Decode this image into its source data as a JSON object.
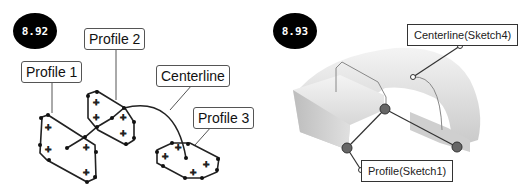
{
  "figures": [
    {
      "badge": "8.92",
      "labels": {
        "profile1": "Profile 1",
        "profile2": "Profile 2",
        "centerline": "Centerline",
        "profile3": "Profile 3"
      }
    },
    {
      "badge": "8.93",
      "labels": {
        "centerline": "Centerline(Sketch4)",
        "profile": "Profile(Sketch1)"
      }
    }
  ],
  "colors": {
    "badge_bg": "#000000",
    "sketch_line": "#222222",
    "leader_line": "#999999",
    "solid_shade": "#d8d8d8"
  }
}
